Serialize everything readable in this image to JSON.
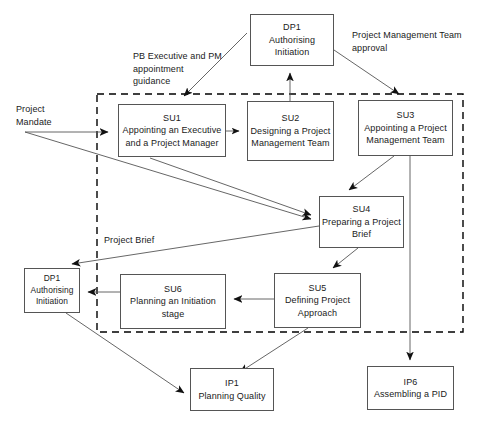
{
  "diagram": {
    "canvas": {
      "width": 486,
      "height": 431
    },
    "colors": {
      "background": "#ffffff",
      "box_border": "#555555",
      "line": "#555555",
      "text": "#1a1a1a",
      "dashed_boundary": "#000000"
    },
    "boundary": {
      "name": "starting-up-a-project-boundary",
      "style": "dashed",
      "x": 97,
      "y": 94,
      "width": 366,
      "height": 238
    },
    "nodes": [
      {
        "id": "dp1-top",
        "code": "DP1",
        "title": "Authorising\nInitiation",
        "x": 250,
        "y": 14,
        "width": 84,
        "height": 52
      },
      {
        "id": "su1",
        "code": "SU1",
        "title": "Appointing an Executive\nand a Project Manager",
        "x": 118,
        "y": 104,
        "width": 108,
        "height": 53
      },
      {
        "id": "su2",
        "code": "SU2",
        "title": "Designing a\nProject\nManagement Team",
        "x": 247,
        "y": 101,
        "width": 87,
        "height": 60
      },
      {
        "id": "su3",
        "code": "SU3",
        "title": "Appointing a Project\nManagement Team",
        "x": 358,
        "y": 100,
        "width": 95,
        "height": 56
      },
      {
        "id": "su4",
        "code": "SU4",
        "title": "Preparing a\nProject Brief",
        "x": 319,
        "y": 196,
        "width": 85,
        "height": 52
      },
      {
        "id": "su5",
        "code": "SU5",
        "title": "Defining\nProject Approach",
        "x": 274,
        "y": 273,
        "width": 87,
        "height": 55
      },
      {
        "id": "su6",
        "code": "SU6",
        "title": "Planning an\nInitiation stage",
        "x": 120,
        "y": 274,
        "width": 106,
        "height": 55
      },
      {
        "id": "dp1-bottom",
        "code": "DP1",
        "title": "Authorising\nInitiation",
        "x": 24,
        "y": 268,
        "width": 56,
        "height": 45
      },
      {
        "id": "ip1",
        "code": "IP1",
        "title": "Planning Quality",
        "x": 190,
        "y": 368,
        "width": 84,
        "height": 43
      },
      {
        "id": "ip6",
        "code": "IP6",
        "title": "Assembling a PID",
        "x": 367,
        "y": 366,
        "width": 87,
        "height": 44
      }
    ],
    "labels": [
      {
        "id": "project-mandate-label",
        "text": "Project\nMandate",
        "x": 16,
        "y": 103
      },
      {
        "id": "pb-executive-guidance-label",
        "text": "PB Executive and PM\nappointment\nguidance",
        "x": 133,
        "y": 50
      },
      {
        "id": "pmt-approval-label",
        "text": "Project Management Team\napproval",
        "x": 352,
        "y": 29
      },
      {
        "id": "project-brief-label",
        "text": "Project Brief",
        "x": 104,
        "y": 234
      }
    ],
    "edges": [
      {
        "id": "project-mandate-to-su1",
        "from": "Project Mandate",
        "to": "SU1"
      },
      {
        "id": "project-mandate-to-su4",
        "from": "Project Mandate",
        "to": "SU4"
      },
      {
        "id": "guidance-to-su1",
        "from": "PB Executive and PM appointment guidance",
        "to": "SU1"
      },
      {
        "id": "su1-to-su2",
        "from": "SU1",
        "to": "SU2"
      },
      {
        "id": "su2-to-dp1-top",
        "from": "SU2",
        "to": "DP1 Authorising Initiation"
      },
      {
        "id": "dp1-top-to-su3",
        "from": "DP1 Authorising Initiation",
        "to": "SU3"
      },
      {
        "id": "su3-to-su4",
        "from": "SU3",
        "to": "SU4"
      },
      {
        "id": "su3-to-ip6",
        "from": "SU3",
        "to": "IP6"
      },
      {
        "id": "su1-to-su4",
        "from": "SU1",
        "to": "SU4"
      },
      {
        "id": "su4-to-su5",
        "from": "SU4",
        "to": "SU5"
      },
      {
        "id": "su5-to-su6",
        "from": "SU5",
        "to": "SU6"
      },
      {
        "id": "su6-to-dp1-bottom",
        "from": "SU6",
        "to": "DP1 Authorising Initiation"
      },
      {
        "id": "su4-to-dp1-bottom",
        "from": "SU4 Project Brief",
        "to": "DP1 Authorising Initiation"
      },
      {
        "id": "dp1-bottom-to-ip1",
        "from": "DP1 Authorising Initiation",
        "to": "IP1"
      },
      {
        "id": "su5-to-ip1",
        "from": "SU5",
        "to": "IP1"
      }
    ]
  }
}
